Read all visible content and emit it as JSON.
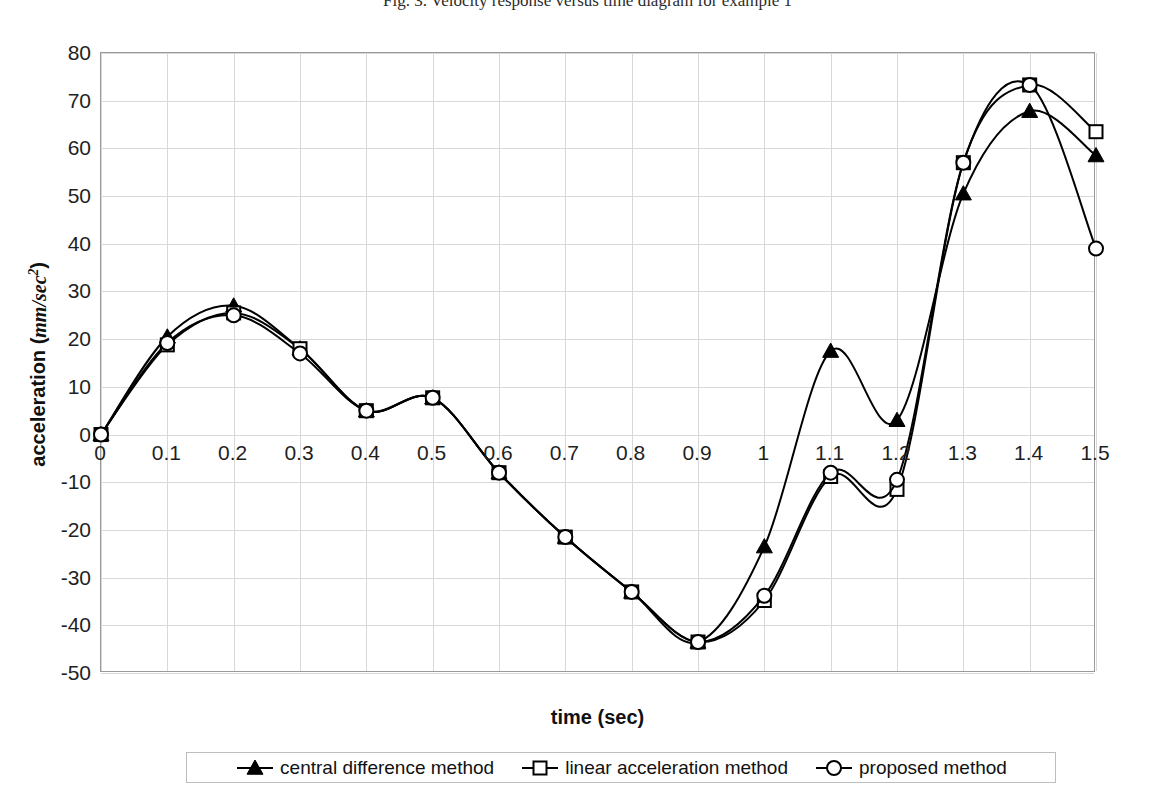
{
  "caption": "Fig. 3. Velocity response versus time diagram for example 1",
  "legend": {
    "entries": [
      {
        "label": "central difference method",
        "marker": "filled-triangle",
        "key": "central"
      },
      {
        "label": "linear acceleration method",
        "marker": "open-square",
        "key": "linear"
      },
      {
        "label": "proposed method",
        "marker": "open-circle",
        "key": "proposed"
      }
    ]
  },
  "chart_data": {
    "type": "line",
    "title": "",
    "xlabel": "time (sec)",
    "ylabel": "acceleration (mm/sec²)",
    "ylabel_text": "acceleration",
    "ylabel_unit": "mm/sec",
    "ylabel_unit_exp": "2",
    "xlim": [
      0,
      1.5
    ],
    "ylim": [
      -50,
      80
    ],
    "xticks": [
      "0",
      "0.1",
      "0.2",
      "0.3",
      "0.4",
      "0.5",
      "0.6",
      "0.7",
      "0.8",
      "0.9",
      "1",
      "1.1",
      "1.2",
      "1.3",
      "1.4",
      "1.5"
    ],
    "xtick_values": [
      0,
      0.1,
      0.2,
      0.3,
      0.4,
      0.5,
      0.6,
      0.7,
      0.8,
      0.9,
      1.0,
      1.1,
      1.2,
      1.3,
      1.4,
      1.5
    ],
    "yticks": [
      "80",
      "70",
      "60",
      "50",
      "40",
      "30",
      "20",
      "10",
      "0",
      "-10",
      "-20",
      "-30",
      "-40",
      "-50"
    ],
    "ytick_values": [
      80,
      70,
      60,
      50,
      40,
      30,
      20,
      10,
      0,
      -10,
      -20,
      -30,
      -40,
      -50
    ],
    "grid": true,
    "legend_position": "bottom",
    "x": [
      0,
      0.1,
      0.2,
      0.3,
      0.4,
      0.5,
      0.6,
      0.7,
      0.8,
      0.9,
      1.0,
      1.1,
      1.2,
      1.3,
      1.4,
      1.5
    ],
    "series": [
      {
        "name": "central difference method",
        "key": "central",
        "marker": "filled-triangle",
        "color": "#000000",
        "values": [
          0,
          20.5,
          27.0,
          18.0,
          5.0,
          7.7,
          -8.0,
          -21.5,
          -33.0,
          -43.5,
          -23.5,
          17.5,
          3.0,
          50.5,
          67.8,
          58.5
        ]
      },
      {
        "name": "linear acceleration method",
        "key": "linear",
        "marker": "open-square",
        "color": "#000000",
        "values": [
          0,
          18.8,
          25.5,
          18.0,
          5.0,
          7.7,
          -8.0,
          -21.5,
          -33.0,
          -43.5,
          -34.8,
          -8.8,
          -11.5,
          57.0,
          73.3,
          63.5
        ]
      },
      {
        "name": "proposed method",
        "key": "proposed",
        "marker": "open-circle",
        "color": "#000000",
        "values": [
          0,
          19.2,
          25.0,
          17.0,
          5.0,
          7.7,
          -8.0,
          -21.5,
          -33.0,
          -43.5,
          -33.8,
          -8.0,
          -9.5,
          57.0,
          73.3,
          39.0
        ]
      }
    ]
  }
}
